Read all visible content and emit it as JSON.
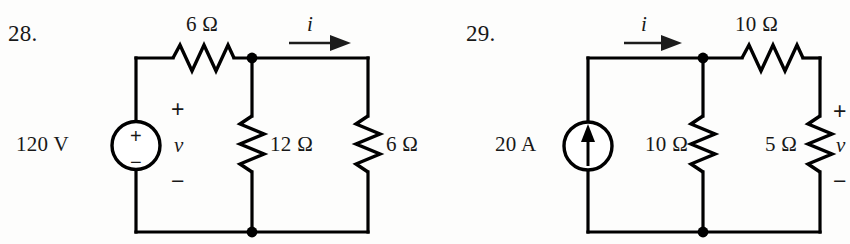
{
  "page": {
    "kind": "textbook-circuit-figure-pair",
    "background_color": "#fdfdfc",
    "ink_color": "#000000"
  },
  "problems": [
    {
      "number_label": "28.",
      "source": {
        "type": "voltage-source",
        "value_label": "120 V",
        "inner_plus": "+",
        "inner_minus": "−"
      },
      "series_resistor": {
        "value_label": "6 Ω",
        "orientation": "horizontal"
      },
      "branch_resistors": [
        {
          "value_label": "12 Ω",
          "orientation": "vertical"
        },
        {
          "value_label": "6 Ω",
          "orientation": "vertical"
        }
      ],
      "current_label": "i",
      "voltage_label": "v",
      "polarity_plus": "+",
      "polarity_minus": "−"
    },
    {
      "number_label": "29.",
      "source": {
        "type": "current-source",
        "value_label": "20 A",
        "arrow_direction": "up"
      },
      "series_resistor": {
        "value_label": "10 Ω",
        "orientation": "horizontal"
      },
      "branch_resistors": [
        {
          "value_label": "10 Ω",
          "orientation": "vertical"
        },
        {
          "value_label": "5 Ω",
          "orientation": "vertical"
        }
      ],
      "current_label": "i",
      "voltage_label": "v",
      "polarity_plus": "+",
      "polarity_minus": "−"
    }
  ]
}
